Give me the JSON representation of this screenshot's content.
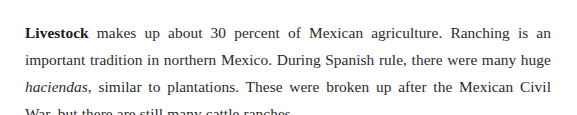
{
  "document": {
    "background_color": "#ffffff",
    "text_color": "#2b2b2b",
    "paragraph": {
      "full_text": "Livestock makes up about 30 percent of Mexican agriculture. Ranching is an important tradition in northern Mexico. During Spanish rule, there were many huge haciendas, similar to plantations. These were broken up after the Mexican Civil War, but there are still many cattle ranches.",
      "lead_term": "Livestock",
      "segment_after_lead": " makes up about 30 percent of Mexican agriculture. Ranching is an important tradition in northern Mexico. During Spanish rule, there were many huge ",
      "italic_term": "haciendas",
      "segment_after_italic": ", similar to plantations. These were broken up after the Mexican Civil War, but there are still many cattle ranches.",
      "lines": [
        "Livestock makes up about 30 percent of Mexican agriculture. Ranching",
        "is an important tradition in northern Mexico. During Spanish rule, there",
        "were many huge haciendas, similar to plantations. These were broken up",
        "after the Mexican Civil War, but there are still many cattle ranches."
      ]
    }
  }
}
